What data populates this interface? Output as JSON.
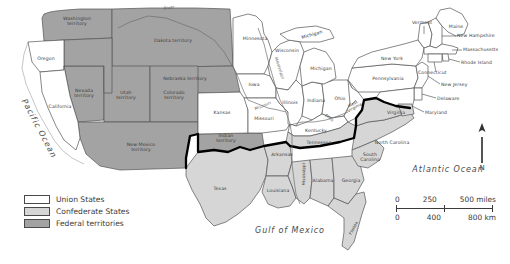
{
  "map": {
    "title": "The United States in 1861",
    "legend": {
      "items": [
        {
          "label": "Union States",
          "color": "#ffffff",
          "key": "union"
        },
        {
          "label": "Confederate States",
          "color": "#d6d6d6",
          "key": "confederate"
        },
        {
          "label": "Federal territories",
          "color": "#a3a3a3",
          "key": "federal"
        }
      ]
    },
    "scale": {
      "miles": [
        "0",
        "250",
        "500 miles"
      ],
      "km": [
        "0",
        "400",
        "800 km"
      ]
    },
    "compass": {
      "north_label": "N"
    },
    "oceans": [
      {
        "name": "Pacific Ocean",
        "label": "Pacific Ocean"
      },
      {
        "name": "Atlantic Ocean",
        "label": "Atlantic Ocean"
      },
      {
        "name": "Gulf of Mexico",
        "label": "Gulf of Mexico"
      }
    ],
    "rivers": [
      {
        "label": "Missouri River"
      },
      {
        "label": "Mississippi River"
      },
      {
        "label": "Ohio River"
      },
      {
        "label": "Missouri"
      }
    ],
    "regions": {
      "federal_territories": [
        {
          "label": "Washington\nterritory"
        },
        {
          "label": "Dakota territory"
        },
        {
          "label": "Nebraska territory"
        },
        {
          "label": "Nevada\nterritory"
        },
        {
          "label": "Utah\nterritory"
        },
        {
          "label": "Colorado\nterritory"
        },
        {
          "label": "New Mexico\nterritory"
        },
        {
          "label": "Indian\nterritory"
        }
      ],
      "union_states": [
        {
          "label": "Oregon"
        },
        {
          "label": "California"
        },
        {
          "label": "Kansas"
        },
        {
          "label": "Minnesota"
        },
        {
          "label": "Wisconsin"
        },
        {
          "label": "Iowa"
        },
        {
          "label": "Missouri"
        },
        {
          "label": "Illinois"
        },
        {
          "label": "Indiana"
        },
        {
          "label": "Ohio"
        },
        {
          "label": "Michigan"
        },
        {
          "label": "Kentucky"
        },
        {
          "label": "West\nVirginia"
        },
        {
          "label": "Pennsylvania"
        },
        {
          "label": "New York"
        },
        {
          "label": "Vermont"
        },
        {
          "label": "Maine"
        },
        {
          "label": "New Hampshire"
        },
        {
          "label": "Massachusetts"
        },
        {
          "label": "Rhode Island"
        },
        {
          "label": "Connecticut"
        },
        {
          "label": "New Jersey"
        },
        {
          "label": "Delaware"
        },
        {
          "label": "Maryland"
        }
      ],
      "confederate_states": [
        {
          "label": "Texas"
        },
        {
          "label": "Arkansas"
        },
        {
          "label": "Louisiana"
        },
        {
          "label": "Mississippi"
        },
        {
          "label": "Alabama"
        },
        {
          "label": "Georgia"
        },
        {
          "label": "Florida"
        },
        {
          "label": "Tennessee"
        },
        {
          "label": "North Carolina"
        },
        {
          "label": "South\nCarolina"
        },
        {
          "label": "Virginia"
        }
      ]
    },
    "labels": {
      "washington_territory": "Washington\nterritory",
      "oregon": "Oregon",
      "california": "California",
      "nevada_territory": "Nevada\nterritory",
      "utah_territory": "Utah\nterritory",
      "colorado_territory": "Colorado\nterritory",
      "new_mexico_territory": "New Mexico\nterritory",
      "dakota_territory": "Dakota territory",
      "nebraska_territory": "Nebraska territory",
      "kansas": "Kansas",
      "indian_territory": "Indian\nterritory",
      "texas": "Texas",
      "minnesota": "Minnesota",
      "wisconsin": "Wisconsin",
      "iowa": "Iowa",
      "missouri": "Missouri",
      "illinois": "Illinois",
      "indiana": "Indiana",
      "ohio": "Ohio",
      "michigan": "Michigan",
      "michigan_upper": "Michigan",
      "kentucky": "Kentucky",
      "west_virginia": "West\nVirginia",
      "pennsylvania": "Pennsylvania",
      "new_york": "New York",
      "vermont": "Vermont",
      "maine": "Maine",
      "new_hampshire": "New Hampshire",
      "massachusetts": "Massachusetts",
      "rhode_island": "Rhode Island",
      "connecticut": "Connecticut",
      "new_jersey": "New Jersey",
      "delaware": "Delaware",
      "maryland": "Maryland",
      "virginia": "Virginia",
      "north_carolina": "North Carolina",
      "south_carolina": "South\nCarolina",
      "tennessee": "Tennessee",
      "arkansas": "Arkansas",
      "louisiana": "Louisiana",
      "mississippi": "Mississippi",
      "alabama": "Alabama",
      "georgia": "Georgia",
      "florida": "Florida",
      "pacific_ocean": "Pacific Ocean",
      "atlantic_ocean": "Atlantic Ocean",
      "gulf_of_mexico": "Gulf of Mexico",
      "missouri_river": "Missouri",
      "mississippi_river": "Mississippi",
      "ohio_river": "Ohio",
      "river_top": "River"
    },
    "colors": {
      "union": "#ffffff",
      "confederate": "#d6d6d6",
      "federal": "#a3a3a3",
      "border": "#555555",
      "confederate_boundary": "#000000",
      "text": "#3a3a3a"
    }
  }
}
